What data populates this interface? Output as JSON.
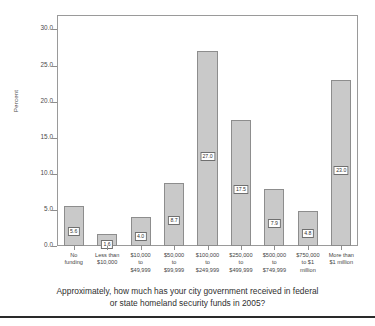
{
  "chart_data": {
    "type": "bar",
    "title": "",
    "subtitle": "",
    "xlabel": "",
    "ylabel": "Percent",
    "ylim": [
      0.0,
      32.0
    ],
    "grid": false,
    "legend": null,
    "categories": [
      "No\nfunding",
      "Less than\n$10,000",
      "$10,000\nto\n$49,999",
      "$50,000\nto\n$99,999",
      "$100,000\nto\n$249,999",
      "$250,000\nto\n$499,999",
      "$500,000\nto\n$749,999",
      "$750,000\nto $1\nmillion",
      "More than\n$1 million"
    ],
    "values": [
      5.6,
      1.6,
      4.0,
      8.7,
      27.0,
      17.5,
      7.9,
      4.8,
      23.0
    ],
    "value_labels": [
      "5.6",
      "1.6",
      "4.0",
      "8.7",
      "27.0",
      "17.5",
      "7.9",
      "4.8",
      "23.0"
    ],
    "yticks": [
      "0.0",
      "5.0",
      "10.0",
      "15.0",
      "20.0",
      "25.0",
      "30.0"
    ],
    "ytick_values": [
      0.0,
      5.0,
      10.0,
      15.0,
      20.0,
      25.0,
      30.0
    ],
    "bar_fill_color": "#c9c9c9",
    "bar_border_color": "#8d8d8d",
    "axis_color": "#9a9a9a",
    "text_color": "#3a3a3a"
  },
  "caption": {
    "line1": "Approximately, how much has your city government received in federal",
    "line2": "or state homeland security funds in 2005?"
  }
}
